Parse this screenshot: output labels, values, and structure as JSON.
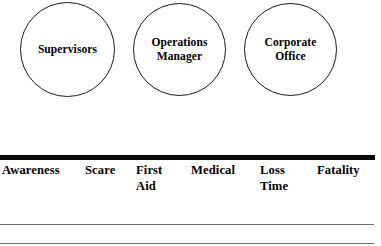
{
  "diagram": {
    "nodes": [
      {
        "id": "supervisors",
        "label": "Supervisors"
      },
      {
        "id": "operations-manager",
        "label": "Operations\nManager"
      },
      {
        "id": "corporate-office",
        "label": "Corporate\nOffice"
      }
    ],
    "severity_scale": {
      "items": [
        {
          "id": "awareness",
          "label": "Awareness"
        },
        {
          "id": "scare",
          "label": "Scare"
        },
        {
          "id": "first-aid",
          "label": "First\nAid"
        },
        {
          "id": "medical",
          "label": "Medical"
        },
        {
          "id": "loss-time",
          "label": "Loss\nTime"
        },
        {
          "id": "fatality",
          "label": "Fatality"
        }
      ]
    },
    "colors": {
      "ink": "#000000",
      "circle_stroke": "#1a1a1a",
      "thick_bar": "#0a0a0a",
      "thin_rule": "#6e6e6e",
      "background": "#ffffff"
    }
  }
}
